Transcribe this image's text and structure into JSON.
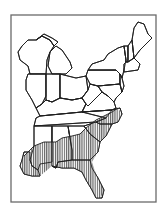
{
  "map": {
    "title": "",
    "region": "Eastern United States",
    "colors": {
      "background": "#ffffff",
      "frame": "#6a6a6a",
      "border": "#1e1e1e",
      "hatch": "#3a3a3a"
    },
    "frame": {
      "x": 11,
      "y": 15,
      "width": 145,
      "height": 187
    },
    "legend": {
      "hatched_area": "distribution range (southeastern coastal plain)",
      "pattern": "vertical-hatch"
    },
    "states": [
      {
        "name": "Wisconsin",
        "points": "22,46 28,40 36,40 42,36 50,40 54,46 50,52 47,60 46,74 30,74 28,66 20,60 18,52"
      },
      {
        "name": "Michigan-Upper",
        "points": "36,40 44,34 52,38 58,42 54,46 50,40 42,36"
      },
      {
        "name": "Michigan-Lower",
        "points": "50,52 56,46 62,50 66,56 70,62 72,68 66,74 52,74 48,66"
      },
      {
        "name": "Illinois",
        "points": "28,74 46,74 46,96 42,104 36,108 32,100 26,90 26,80"
      },
      {
        "name": "Indiana",
        "points": "46,74 60,74 60,98 52,102 46,100 46,96"
      },
      {
        "name": "Ohio",
        "points": "60,74 76,78 86,76 88,90 82,98 72,100 60,98"
      },
      {
        "name": "Kentucky",
        "points": "36,108 42,104 46,100 52,102 60,98 72,100 82,98 86,104 82,112 40,116"
      },
      {
        "name": "Tennessee",
        "points": "36,118 40,116 82,112 112,110 106,118 96,122 34,126"
      },
      {
        "name": "West-Virginia",
        "points": "82,98 88,90 90,84 98,86 102,92 94,100 88,106 86,104"
      },
      {
        "name": "Virginia",
        "points": "86,104 88,106 94,100 102,92 108,96 114,102 116,108 112,110 82,112"
      },
      {
        "name": "North-Carolina",
        "points": "82,112 112,110 120,108 122,114 118,122 112,124 100,124 96,122 106,118"
      },
      {
        "name": "Pennsylvania",
        "points": "86,76 88,70 116,70 120,74 120,84 98,86 90,84"
      },
      {
        "name": "New-York",
        "points": "88,70 92,64 104,60 108,54 118,48 124,46 126,60 124,70 122,78 120,74 116,70"
      },
      {
        "name": "Maryland-Delaware",
        "points": "98,86 120,84 122,92 116,98 114,102 108,96 102,92"
      },
      {
        "name": "New-Jersey",
        "points": "120,74 122,78 124,86 122,92 120,84"
      },
      {
        "name": "Vermont",
        "points": "124,46 128,46 128,62 126,62 126,60"
      },
      {
        "name": "New-Hampshire",
        "points": "128,46 132,40 134,58 128,62"
      },
      {
        "name": "Maine",
        "points": "132,40 134,28 138,22 144,24 148,34 152,38 146,44 140,50 134,58"
      },
      {
        "name": "Massachusetts-CT-RI",
        "points": "124,64 126,62 128,62 134,58 140,64 138,70 124,72"
      },
      {
        "name": "Mississippi",
        "points": "34,126 52,126 52,162 40,164 38,170 32,166 30,160 34,146"
      },
      {
        "name": "Alabama",
        "points": "52,126 68,126 72,150 72,160 58,162 56,168 52,166 52,162"
      },
      {
        "name": "Georgia",
        "points": "68,126 84,126 90,134 100,142 98,152 90,160 72,160 72,150"
      },
      {
        "name": "South-Carolina",
        "points": "84,126 96,122 100,124 112,124 106,136 100,142 90,134"
      },
      {
        "name": "Louisiana",
        "points": "24,152 30,152 30,160 32,166 38,170 40,176 32,176 24,174 20,166 22,160"
      },
      {
        "name": "Florida",
        "points": "52,166 56,168 58,162 72,160 90,160 92,168 98,178 104,190 102,198 96,198 92,190 86,180 82,172 74,168 62,168"
      }
    ],
    "range_polygon": "24,156 30,150 34,146 44,142 56,142 62,138 72,136 80,134 86,128 96,120 104,116 112,112 118,108 122,114 118,122 112,124 106,136 100,142 98,152 92,162 96,174 102,186 104,192 100,198 96,198 92,190 86,180 82,172 74,168 62,168 52,166 40,176 32,176 24,174 20,166 22,160",
    "range_edge": "24,156 30,150 34,146 44,142 56,142 62,138 72,136 80,134 86,128 96,120 104,116 112,112 118,108"
  }
}
